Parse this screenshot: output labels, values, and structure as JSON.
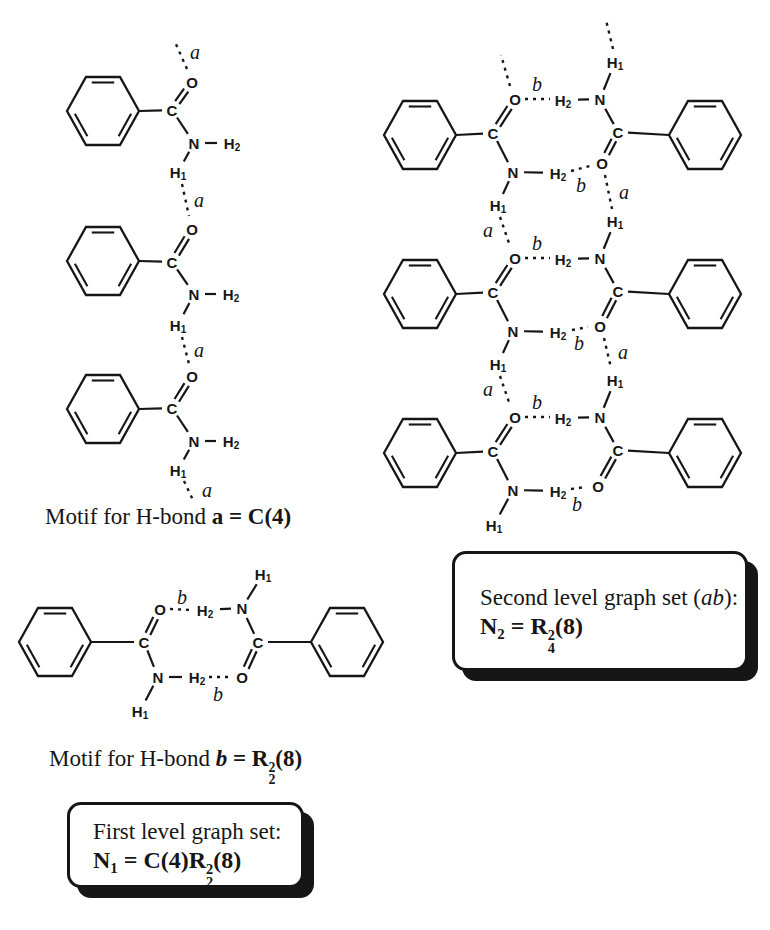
{
  "colors": {
    "background": "#ffffff",
    "ink": "#161616"
  },
  "atoms": {
    "carbon": "C",
    "oxygen": "O",
    "nitrogen": "N",
    "hydrogen": "H",
    "h1_sub": "1",
    "h2_sub": "2"
  },
  "bond_labels": {
    "a": "a",
    "b": "b"
  },
  "captions": {
    "motif_a": {
      "tokens": [
        {
          "t": "Motif for H-bond "
        },
        {
          "t": "a",
          "b": 1
        },
        {
          "t": " = C(4)",
          "b": 1
        }
      ]
    },
    "motif_b": {
      "tokens": [
        {
          "t": "Motif for H-bond "
        },
        {
          "t": "b",
          "b": 1,
          "i": 1
        },
        {
          "t": " = R",
          "b": 1
        },
        {
          "stk": [
            "2",
            "2"
          ],
          "b": 1
        },
        {
          "t": "(8)",
          "b": 1
        }
      ]
    }
  },
  "boxes": {
    "first_level": {
      "line1": [
        {
          "t": "First level graph set:"
        }
      ],
      "line2": [
        {
          "t": "N",
          "b": 1
        },
        {
          "t": "1",
          "b": 1,
          "sub": 1
        },
        {
          "t": " = C(4)R",
          "b": 1
        },
        {
          "stk": [
            "2",
            "2"
          ],
          "b": 1
        },
        {
          "t": "(8)",
          "b": 1
        }
      ]
    },
    "second_level": {
      "line1": [
        {
          "t": "Second level graph set ("
        },
        {
          "t": "ab",
          "i": 1
        },
        {
          "t": "):"
        }
      ],
      "line2": [
        {
          "t": "N",
          "b": 1
        },
        {
          "t": "2",
          "b": 1,
          "sub": 1
        },
        {
          "t": " = R",
          "b": 1
        },
        {
          "stk": [
            "2",
            "4"
          ],
          "b": 1
        },
        {
          "t": "(8)",
          "b": 1
        }
      ]
    }
  },
  "diagram": {
    "ring": {
      "rx": 36,
      "ry": 34,
      "kx": 17,
      "inner_offset": 5.5,
      "inner_shrink": 0.66
    },
    "units": [
      {
        "name": "chain-1",
        "type": "L",
        "ring": [
          103,
          111
        ],
        "C": [
          172,
          110
        ],
        "O": [
          192,
          82
        ],
        "N": [
          194,
          143
        ],
        "H2": [
          232,
          143
        ],
        "H1": [
          178,
          172
        ]
      },
      {
        "name": "chain-2",
        "type": "L",
        "ring": [
          103,
          261
        ],
        "C": [
          172,
          262
        ],
        "O": [
          192,
          229
        ],
        "N": [
          194,
          294
        ],
        "H2": [
          231,
          294
        ],
        "H1": [
          178,
          325
        ]
      },
      {
        "name": "chain-3",
        "type": "L",
        "ring": [
          103,
          409
        ],
        "C": [
          172,
          408
        ],
        "O": [
          192,
          376
        ],
        "N": [
          194,
          441
        ],
        "H2": [
          231,
          441
        ],
        "H1": [
          178,
          470
        ]
      },
      {
        "name": "ladder-left-1",
        "type": "L",
        "ring": [
          420,
          135
        ],
        "C": [
          493,
          133
        ],
        "O": [
          515,
          99
        ],
        "N": [
          513,
          172
        ],
        "H2": [
          558,
          173
        ],
        "H1": [
          498,
          205
        ]
      },
      {
        "name": "ladder-left-2",
        "type": "L",
        "ring": [
          420,
          294
        ],
        "C": [
          493,
          292
        ],
        "O": [
          515,
          258
        ],
        "N": [
          513,
          331
        ],
        "H2": [
          558,
          332
        ],
        "H1": [
          498,
          364
        ]
      },
      {
        "name": "ladder-left-3",
        "type": "L",
        "ring": [
          420,
          453
        ],
        "C": [
          493,
          451
        ],
        "O": [
          515,
          417
        ],
        "N": [
          513,
          490
        ],
        "H2": [
          558,
          491
        ],
        "H1": [
          494,
          525
        ]
      },
      {
        "name": "ladder-right-1",
        "type": "R",
        "ring": [
          705,
          135
        ],
        "C": [
          618,
          132
        ],
        "O": [
          602,
          163
        ],
        "N": [
          600,
          99
        ],
        "H2": [
          563,
          100
        ],
        "H1": [
          615,
          62
        ]
      },
      {
        "name": "ladder-right-2",
        "type": "R",
        "ring": [
          705,
          294
        ],
        "C": [
          618,
          291
        ],
        "O": [
          600,
          326
        ],
        "N": [
          600,
          258
        ],
        "H2": [
          563,
          259
        ],
        "H1": [
          615,
          221
        ]
      },
      {
        "name": "ladder-right-3",
        "type": "R",
        "ring": [
          705,
          453
        ],
        "C": [
          618,
          450
        ],
        "O": [
          598,
          486
        ],
        "N": [
          600,
          417
        ],
        "H2": [
          563,
          418
        ],
        "H1": [
          615,
          380
        ]
      },
      {
        "name": "dimer-left",
        "type": "L",
        "ring": [
          55,
          642
        ],
        "C": [
          144,
          642
        ],
        "O": [
          160,
          609
        ],
        "N": [
          158,
          677
        ],
        "H2": [
          197,
          677
        ],
        "H1": [
          140,
          711
        ]
      },
      {
        "name": "dimer-right",
        "type": "R",
        "ring": [
          347,
          642
        ],
        "C": [
          258,
          642
        ],
        "O": [
          242,
          677
        ],
        "N": [
          242,
          608
        ],
        "H2": [
          205,
          610
        ],
        "H1": [
          263,
          574
        ]
      }
    ],
    "hbonds": [
      {
        "x1": 187,
        "y1": 69,
        "x2": 175,
        "y2": 42,
        "label": "a",
        "lx": 195,
        "ly": 52
      },
      {
        "x1": 182,
        "y1": 184,
        "x2": 189,
        "y2": 216,
        "label": "a",
        "lx": 199,
        "ly": 200
      },
      {
        "x1": 182,
        "y1": 337,
        "x2": 189,
        "y2": 364,
        "label": "a",
        "lx": 199,
        "ly": 350
      },
      {
        "x1": 184,
        "y1": 481,
        "x2": 193,
        "y2": 500,
        "label": "a",
        "lx": 207,
        "ly": 490
      },
      {
        "x1": 510,
        "y1": 86,
        "x2": 501,
        "y2": 55
      },
      {
        "x1": 613,
        "y1": 49,
        "x2": 606,
        "y2": 20
      },
      {
        "x1": 525,
        "y1": 99,
        "x2": 550,
        "y2": 99,
        "label": "b",
        "lx": 537,
        "ly": 84
      },
      {
        "x1": 571,
        "y1": 171,
        "x2": 590,
        "y2": 166,
        "label": "b",
        "lx": 581,
        "ly": 185
      },
      {
        "x1": 500,
        "y1": 217,
        "x2": 510,
        "y2": 246,
        "label": "a",
        "lx": 488,
        "ly": 230
      },
      {
        "x1": 605,
        "y1": 175,
        "x2": 612,
        "y2": 209,
        "label": "a",
        "lx": 624,
        "ly": 192
      },
      {
        "x1": 525,
        "y1": 258,
        "x2": 550,
        "y2": 258,
        "label": "b",
        "lx": 537,
        "ly": 243
      },
      {
        "x1": 572,
        "y1": 330,
        "x2": 588,
        "y2": 327,
        "label": "b",
        "lx": 579,
        "ly": 343
      },
      {
        "x1": 500,
        "y1": 376,
        "x2": 510,
        "y2": 405,
        "label": "a",
        "lx": 488,
        "ly": 389
      },
      {
        "x1": 604,
        "y1": 338,
        "x2": 611,
        "y2": 368,
        "label": "a",
        "lx": 623,
        "ly": 352
      },
      {
        "x1": 525,
        "y1": 417,
        "x2": 550,
        "y2": 417,
        "label": "b",
        "lx": 537,
        "ly": 402
      },
      {
        "x1": 571,
        "y1": 489,
        "x2": 586,
        "y2": 487,
        "label": "b",
        "lx": 577,
        "ly": 504
      },
      {
        "x1": 170,
        "y1": 609,
        "x2": 192,
        "y2": 610,
        "label": "b",
        "lx": 182,
        "ly": 597
      },
      {
        "x1": 209,
        "y1": 677,
        "x2": 230,
        "y2": 677,
        "label": "b",
        "lx": 218,
        "ly": 694
      }
    ]
  }
}
